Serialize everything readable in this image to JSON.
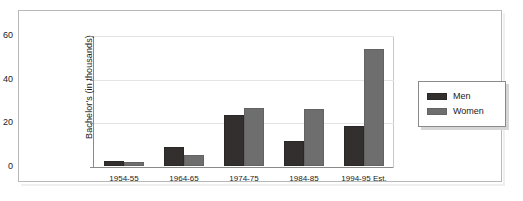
{
  "chart_data": {
    "type": "bar",
    "title": "",
    "subtitle": "",
    "xlabel": "",
    "ylabel": "Bachelor's (in thousands)",
    "categories": [
      "1954-55",
      "1964-65",
      "1974-75",
      "1984-85",
      "1994-95 Est."
    ],
    "series": [
      {
        "name": "Men",
        "color": "#332f2f",
        "values": [
          2.5,
          8.5,
          23.5,
          11.5,
          18.5
        ]
      },
      {
        "name": "Women",
        "color": "#6e6e6e",
        "values": [
          2,
          5,
          26.5,
          26,
          53.5
        ]
      }
    ],
    "ylim": [
      0,
      60
    ],
    "yticks": [
      0,
      20,
      40,
      60
    ],
    "ytick_labels": [
      "0",
      "20",
      "40",
      "60"
    ],
    "grid": true,
    "legend_position": "right"
  },
  "legend": {
    "entries": [
      {
        "label": "Men",
        "swatch": "men-color-swatch"
      },
      {
        "label": "Women",
        "swatch": "women-color-swatch"
      }
    ]
  }
}
